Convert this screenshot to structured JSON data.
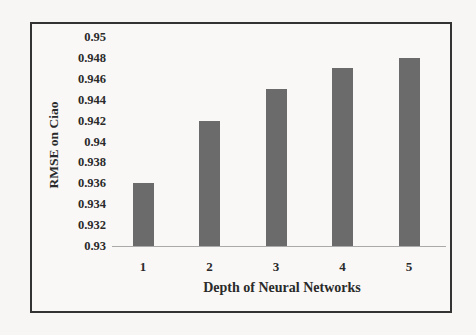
{
  "chart_data": {
    "type": "bar",
    "title": "",
    "xlabel": "Depth of Neural Networks",
    "ylabel": "RMSE on Ciao",
    "categories": [
      "1",
      "2",
      "3",
      "4",
      "5"
    ],
    "values": [
      0.936,
      0.942,
      0.945,
      0.947,
      0.948
    ],
    "ylim": [
      0.93,
      0.95
    ],
    "yticks": [
      "0.95",
      "0.948",
      "0.946",
      "0.944",
      "0.942",
      "0.94",
      "0.938",
      "0.936",
      "0.934",
      "0.932",
      "0.93"
    ],
    "grid": false,
    "legend": null,
    "bar_color": "#6b6b6b"
  }
}
